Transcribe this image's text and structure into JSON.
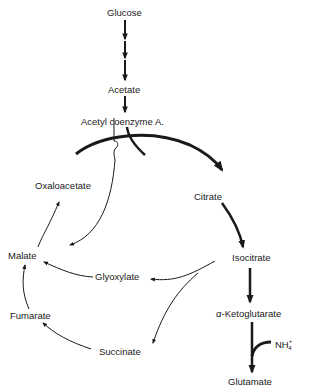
{
  "diagram": {
    "type": "metabolic-pathway",
    "nodes": {
      "glucose": "Glucose",
      "acetate": "Acetate",
      "acetyl_coa": "Acetyl coenzyme A.",
      "citrate": "Citrate",
      "isocitrate": "Isocitrate",
      "alpha_ketoglutarate": "α-Ketoglutarate",
      "glutamate": "Glutamate",
      "oxaloacetate": "Oxaloacetate",
      "malate": "Malate",
      "glyoxylate": "Glyoxylate",
      "fumarate": "Fumarate",
      "succinate": "Succinate",
      "ammonium": "NH",
      "ammonium_charge": "+",
      "ammonium_subscript": "4"
    },
    "edges": [
      {
        "from": "Glucose",
        "to": "Acetate",
        "style": "multi-step"
      },
      {
        "from": "Acetate",
        "to": "Acetyl coenzyme A.",
        "style": "single"
      },
      {
        "from": "Acetyl coenzyme A.",
        "to": "Citrate",
        "style": "bold"
      },
      {
        "from": "Oxaloacetate",
        "to": "Citrate",
        "style": "bold"
      },
      {
        "from": "Citrate",
        "to": "Isocitrate",
        "style": "bold"
      },
      {
        "from": "Isocitrate",
        "to": "α-Ketoglutarate",
        "style": "bold"
      },
      {
        "from": "α-Ketoglutarate",
        "to": "Glutamate",
        "style": "bold",
        "input": "NH4+"
      },
      {
        "from": "Isocitrate",
        "to": "Glyoxylate",
        "style": "thin"
      },
      {
        "from": "Isocitrate",
        "to": "Succinate",
        "style": "thin"
      },
      {
        "from": "Glyoxylate",
        "to": "Malate",
        "style": "thin"
      },
      {
        "from": "Acetyl coenzyme A.",
        "to": "Malate",
        "style": "thin"
      },
      {
        "from": "Succinate",
        "to": "Fumarate",
        "style": "thin"
      },
      {
        "from": "Fumarate",
        "to": "Malate",
        "style": "thin"
      },
      {
        "from": "Malate",
        "to": "Oxaloacetate",
        "style": "thin"
      }
    ],
    "colors": {
      "ink": "#1a1a1a",
      "background": "#ffffff"
    }
  }
}
